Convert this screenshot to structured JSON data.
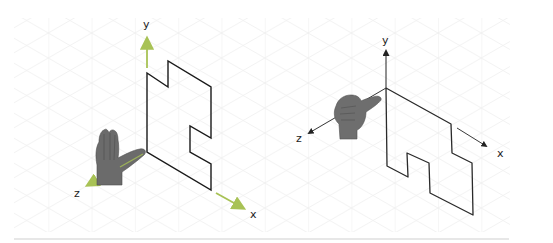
{
  "figure": {
    "colors": {
      "grid": "#ececec",
      "grid_vertical": "#e6e6e6",
      "shape_stroke": "#1a1a1a",
      "left_axis": "#a8c255",
      "right_axis": "#333333",
      "hand": "#6b6b6b",
      "baseline": "#cfcfcf"
    },
    "left_panel": {
      "axes": {
        "y_label": "y",
        "x_label": "x",
        "z_label": "z"
      },
      "hand_gesture": "open-palm",
      "shape": "stepped polygon in the x-y plane"
    },
    "right_panel": {
      "axes": {
        "y_label": "y",
        "x_label": "x",
        "z_label": "z"
      },
      "hand_gesture": "thumbs-along-z",
      "shape": "sketched stepped polygon hanging below x axis"
    }
  }
}
